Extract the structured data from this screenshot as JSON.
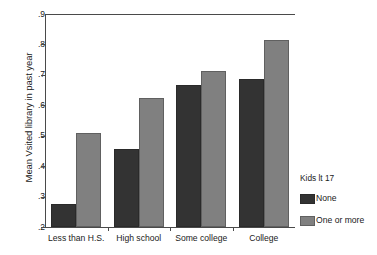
{
  "chart_data": {
    "type": "bar",
    "title": "",
    "xlabel": "",
    "ylabel": "Mean Vsited library in past year",
    "categories": [
      "Less than H.S.",
      "High school",
      "Some college",
      "College"
    ],
    "series": [
      {
        "name": "None",
        "color": "#333333",
        "values": [
          0.275,
          0.457,
          0.666,
          0.685
        ]
      },
      {
        "name": "One or more",
        "color": "#808080",
        "values": [
          0.51,
          0.623,
          0.712,
          0.815
        ]
      }
    ],
    "ylim": [
      0.2,
      0.9
    ],
    "yticks": [
      0.9,
      0.8,
      0.7,
      0.6,
      0.5,
      0.4,
      0.3,
      0.2
    ],
    "ytick_labels": [
      ".9",
      ".8",
      ".7",
      ".6",
      ".5",
      ".4",
      ".3",
      ".2"
    ],
    "grid": false,
    "legend": {
      "title": "Kids lt 17",
      "position": "right",
      "entries": [
        {
          "label": "None",
          "color": "#333333"
        },
        {
          "label": "One or more",
          "color": "#808080"
        }
      ]
    }
  }
}
